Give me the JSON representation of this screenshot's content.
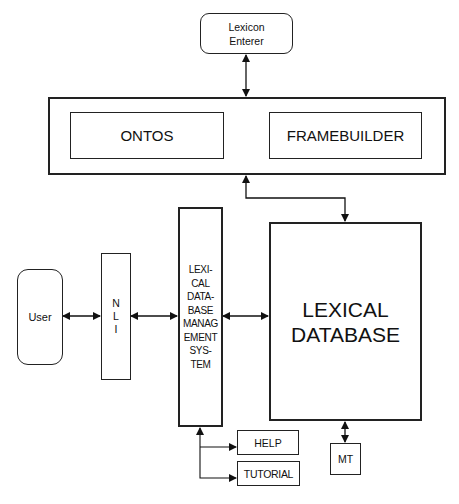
{
  "diagram": {
    "nodes": {
      "lexicon_enterer": {
        "label": "Lexicon\nEnterer"
      },
      "ontos": {
        "label": "ONTOS"
      },
      "framebuilder": {
        "label": "FRAMEBUILDER"
      },
      "user": {
        "label": "User"
      },
      "nli": {
        "label": "N\nL\nI"
      },
      "ldbms": {
        "label": "LEXI-\nCAL\nDATA-\nBASE\nMANAG\nEMENT\nSYS-\nTEM"
      },
      "lexical_database": {
        "label": "LEXICAL\nDATABASE"
      },
      "help": {
        "label": "HELP"
      },
      "tutorial": {
        "label": "TUTORIAL"
      },
      "mt": {
        "label": "MT"
      }
    },
    "edges": [
      {
        "from": "lexicon_enterer",
        "to": "ontos_framebuilder_frame",
        "type": "bidirectional"
      },
      {
        "from": "ontos_framebuilder_frame",
        "to": "lexical_database",
        "type": "bidirectional"
      },
      {
        "from": "user",
        "to": "nli",
        "type": "bidirectional"
      },
      {
        "from": "nli",
        "to": "ldbms",
        "type": "bidirectional"
      },
      {
        "from": "ldbms",
        "to": "lexical_database",
        "type": "bidirectional"
      },
      {
        "from": "lexical_database",
        "to": "mt",
        "type": "bidirectional"
      },
      {
        "from": "ldbms",
        "to": "help",
        "type": "bidirectional"
      },
      {
        "from": "ldbms",
        "to": "tutorial",
        "type": "bidirectional"
      }
    ],
    "colors": {
      "stroke": "#222222",
      "background": "#ffffff"
    }
  }
}
